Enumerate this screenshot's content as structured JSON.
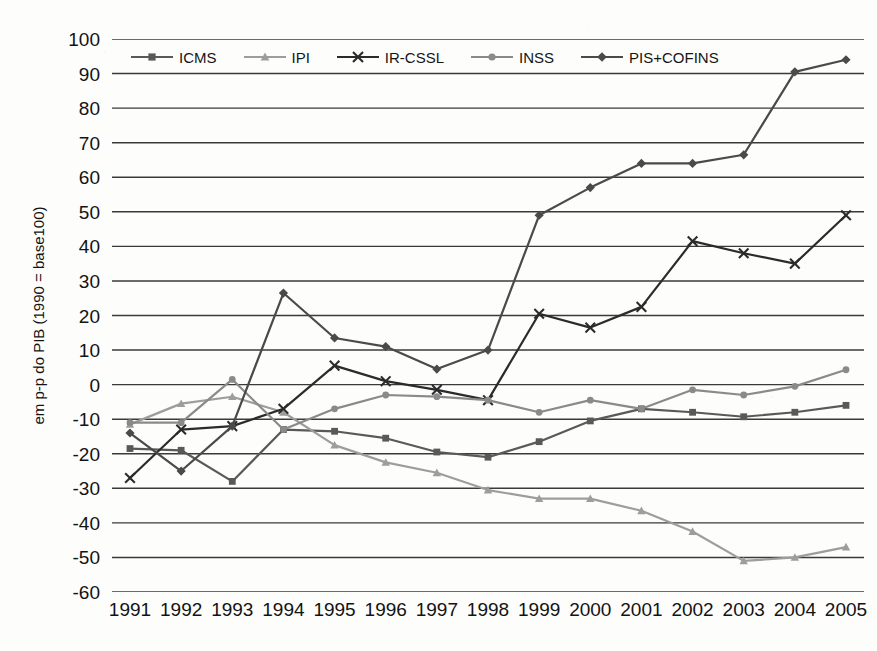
{
  "chart_data": {
    "type": "line",
    "title": "",
    "subtitle": "",
    "xlabel": "",
    "ylabel": "em p-p do PIB (1990 = base100)",
    "categories": [
      "1991",
      "1992",
      "1993",
      "1994",
      "1995",
      "1996",
      "1997",
      "1998",
      "1999",
      "2000",
      "2001",
      "2002",
      "2003",
      "2004",
      "2005"
    ],
    "x": [
      1991,
      1992,
      1993,
      1994,
      1995,
      1996,
      1997,
      1998,
      1999,
      2000,
      2001,
      2002,
      2003,
      2004,
      2005
    ],
    "ylim": [
      -60,
      100
    ],
    "ytick_step": 10,
    "yticks": [
      100,
      90,
      80,
      70,
      60,
      50,
      40,
      30,
      20,
      10,
      0,
      -10,
      -20,
      -30,
      -40,
      -50,
      -60
    ],
    "ytick_labels": [
      "100",
      "90",
      "80",
      "70",
      "60",
      "50",
      "40",
      "30",
      "20",
      "10",
      "0",
      "-10",
      "-20",
      "-30",
      "-40",
      "-50",
      "-60"
    ],
    "grid": "horizontal",
    "legend_position": "top-inside",
    "series": [
      {
        "name": "ICMS",
        "marker": "square",
        "color": "#595959",
        "values": [
          -18.5,
          -19.0,
          -28.0,
          -13.0,
          -13.5,
          -15.5,
          -19.5,
          -21.0,
          -16.5,
          -10.5,
          -7.0,
          -8.0,
          -9.3,
          -8.0,
          -6.0
        ]
      },
      {
        "name": "IPI",
        "marker": "triangle",
        "color": "#9d9d9d",
        "values": [
          -11.5,
          -5.5,
          -3.5,
          -8.0,
          -17.5,
          -22.5,
          -25.5,
          -30.5,
          -33.0,
          -33.0,
          -36.5,
          -42.5,
          -51.0,
          -50.0,
          -47.0
        ]
      },
      {
        "name": "IR-CSSL",
        "marker": "x",
        "color": "#2b2b2b",
        "values": [
          -27.0,
          -13.0,
          -12.0,
          -7.0,
          5.5,
          1.0,
          -1.5,
          -4.5,
          20.5,
          16.5,
          22.5,
          41.5,
          38.0,
          35.0,
          49.0
        ]
      },
      {
        "name": "INSS",
        "marker": "circle",
        "color": "#8a8a8a",
        "values": [
          -11.0,
          -11.0,
          1.5,
          -13.0,
          -7.0,
          -3.0,
          -3.5,
          -4.5,
          -8.0,
          -4.5,
          -7.0,
          -1.5,
          -3.0,
          -0.5,
          4.3
        ]
      },
      {
        "name": "PIS+COFINS",
        "marker": "diamond",
        "color": "#4a4a4a",
        "values": [
          -14.0,
          -25.0,
          -12.0,
          26.5,
          13.5,
          11.0,
          4.5,
          10.0,
          49.0,
          57.0,
          64.0,
          64.0,
          66.5,
          90.5,
          94.0
        ]
      }
    ]
  },
  "legend": {
    "items": [
      {
        "label": "ICMS"
      },
      {
        "label": "IPI"
      },
      {
        "label": "IR-CSSL"
      },
      {
        "label": "INSS"
      },
      {
        "label": "PIS+COFINS"
      }
    ]
  },
  "colors": {
    "icms": "#595959",
    "ipi": "#9d9d9d",
    "ir_cssl": "#2b2b2b",
    "inss": "#8a8a8a",
    "pis_cofins": "#4a4a4a",
    "grid": "#3a3a3a",
    "text": "#131313",
    "background": "#fdfdfc"
  }
}
